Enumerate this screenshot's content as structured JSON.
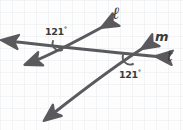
{
  "figure": {
    "paper": {
      "background_color": "#fdfdfd",
      "grid_color": "#e4e7ea",
      "grid_spacing_px": 12
    },
    "ink": {
      "stroke_color": "#5a5a5e",
      "stroke_width": 3.1,
      "text_color": "#3a3a3a"
    },
    "lines": [
      {
        "id": "l",
        "label": "ℓ",
        "role": "transversal",
        "from": [
          42,
          113
        ],
        "to": [
          112,
          20
        ],
        "arrow_start": true,
        "arrow_end": true
      },
      {
        "id": "m",
        "label": "m",
        "role": "parallel-line-lower",
        "from": [
          6,
          44
        ],
        "to": [
          152,
          43
        ],
        "arrow_start": true,
        "arrow_end": true
      },
      {
        "id": "t",
        "label": "t",
        "role": "parallel-line-upper",
        "from": [
          7,
          41
        ],
        "to": [
          166,
          58
        ],
        "arrow_start": true,
        "arrow_end": true
      }
    ],
    "intersections": [
      {
        "id": "upper",
        "point": [
          58,
          47
        ],
        "arc_label": "121",
        "unit": "°"
      },
      {
        "id": "lower",
        "point": [
          128,
          60
        ],
        "arc_label": "121",
        "unit": "°"
      }
    ],
    "angle_labels": [
      {
        "id": "angle-1",
        "value": "121",
        "unit": "°",
        "x": 45,
        "y": 26
      },
      {
        "id": "angle-2",
        "value": "121",
        "unit": "°",
        "x": 119,
        "y": 69
      }
    ],
    "line_labels": [
      {
        "id": "label-l",
        "text": "ℓ"
      },
      {
        "id": "label-m",
        "text": "m"
      },
      {
        "id": "label-t",
        "text": "t"
      }
    ]
  }
}
